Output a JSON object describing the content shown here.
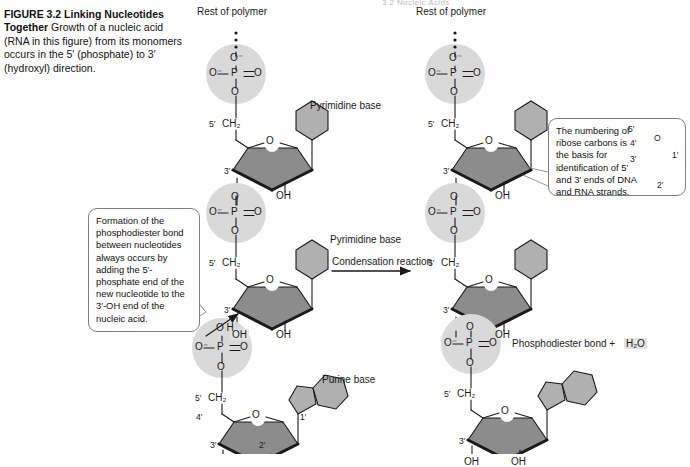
{
  "figure": {
    "number": "FIGURE 3.2",
    "title": "Linking Nucleotides Together",
    "caption": "Growth of a nucleic acid (RNA in this figure) from its monomers occurs in the 5′ (phosphate) to 3′ (hydroxyl) direction.",
    "running_header": "3.2 Nucleic Acids"
  },
  "labels": {
    "rest_of_polymer": "Rest of polymer",
    "pyrimidine_base": "Pyrimidine base",
    "purine_base": "Purine base",
    "condensation_reaction": "Condensation reaction",
    "phosphodiester_bond": "Phosphodiester bond",
    "plus": "+",
    "water": "H₂O",
    "oh": "OH",
    "o": "O",
    "o_minus": "O⁻",
    "p": "P",
    "h": "H",
    "ch2": "CH₂"
  },
  "primes": {
    "c1": "1′",
    "c2": "2′",
    "c3": "3′",
    "c4": "4′",
    "c5": "5′"
  },
  "callouts": {
    "phosphodiester": "Formation of the phosphodiester bond between nucleotides always occurs by adding the 5′-phosphate end of the new nucleotide to the 3′-OH end of the nucleic acid.",
    "numbering": "The numbering of ribose carbons is the basis for identification of 5′ and 3′ ends of DNA and RNA strands."
  },
  "colors": {
    "phosphate_circle": "#d9d9d9",
    "ribose_fill": "#8c8c8c",
    "base_fill": "#b0b0b0",
    "stroke": "#1a1a1a",
    "callout_border": "#7d7d86",
    "highlight": "#e3e3e3"
  }
}
